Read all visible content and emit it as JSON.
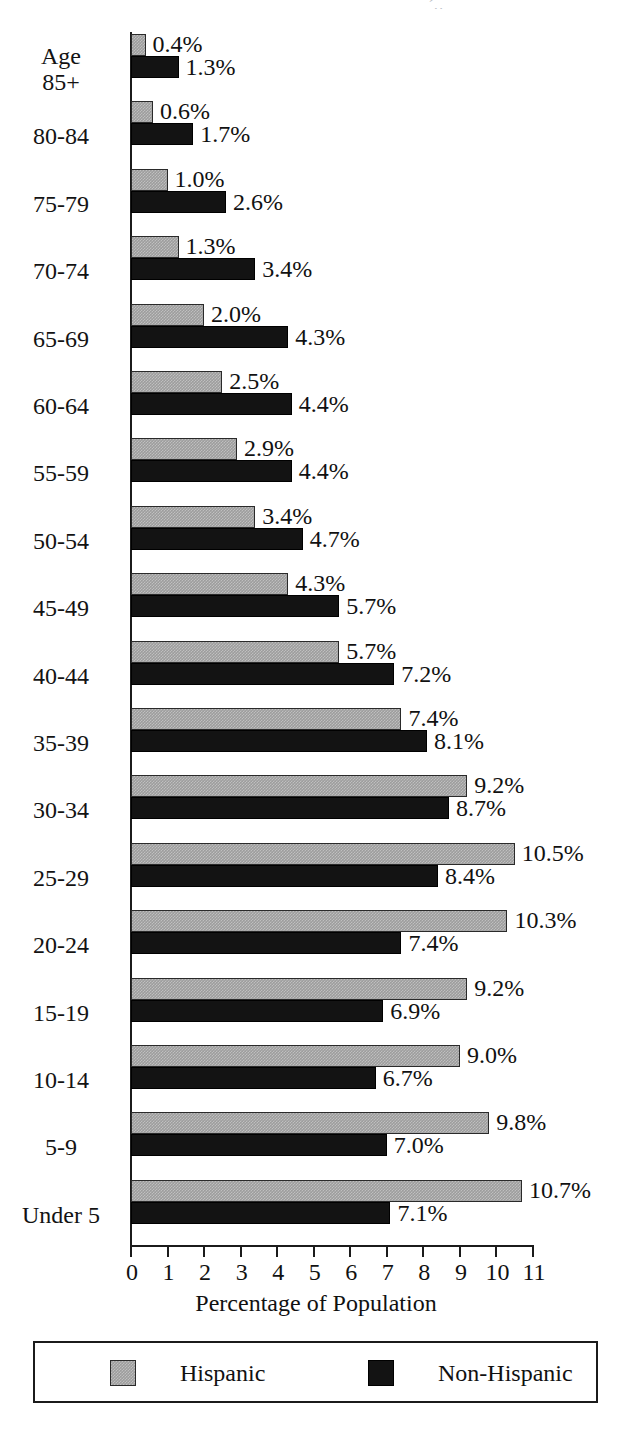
{
  "scan_artifact": "´,,",
  "chart_data": {
    "type": "bar",
    "orientation": "horizontal",
    "title": "",
    "subtitle": "",
    "xlabel": "Percentage of Population",
    "ylabel": "",
    "xlim": [
      0,
      11
    ],
    "xticks": [
      "0",
      "1",
      "2",
      "3",
      "4",
      "5",
      "6",
      "7",
      "8",
      "9",
      "10",
      "11"
    ],
    "grid": false,
    "legend_position": "bottom",
    "value_suffix": "%",
    "categories": [
      "Age 85+",
      "80-84",
      "75-79",
      "70-74",
      "65-69",
      "60-64",
      "55-59",
      "50-54",
      "45-49",
      "40-44",
      "35-39",
      "30-34",
      "25-29",
      "20-24",
      "15-19",
      "10-14",
      "5-9",
      "Under 5"
    ],
    "category_lines": [
      [
        "Age",
        "85+"
      ],
      [
        "80-84"
      ],
      [
        "75-79"
      ],
      [
        "70-74"
      ],
      [
        "65-69"
      ],
      [
        "60-64"
      ],
      [
        "55-59"
      ],
      [
        "50-54"
      ],
      [
        "45-49"
      ],
      [
        "40-44"
      ],
      [
        "35-39"
      ],
      [
        "30-34"
      ],
      [
        "25-29"
      ],
      [
        "20-24"
      ],
      [
        "15-19"
      ],
      [
        "10-14"
      ],
      [
        "5-9"
      ],
      [
        "Under 5"
      ]
    ],
    "series": [
      {
        "name": "Hispanic",
        "color": "#9d9d9d",
        "values": [
          0.4,
          0.6,
          1.0,
          1.3,
          2.0,
          2.5,
          2.9,
          3.4,
          4.3,
          5.7,
          7.4,
          9.2,
          10.5,
          10.3,
          9.2,
          9.0,
          9.8,
          10.7
        ],
        "labels": [
          "0.4%",
          "0.6%",
          "1.0%",
          "1.3%",
          "2.0%",
          "2.5%",
          "2.9%",
          "3.4%",
          "4.3%",
          "5.7%",
          "7.4%",
          "9.2%",
          "10.5%",
          "10.3%",
          "9.2%",
          "9.0%",
          "9.8%",
          "10.7%"
        ]
      },
      {
        "name": "Non-Hispanic",
        "color": "#131313",
        "values": [
          1.3,
          1.7,
          2.6,
          3.4,
          4.3,
          4.4,
          4.4,
          4.7,
          5.7,
          7.2,
          8.1,
          8.7,
          8.4,
          7.4,
          6.9,
          6.7,
          7.0,
          7.1
        ],
        "labels": [
          "1.3%",
          "1.7%",
          "2.6%",
          "3.4%",
          "4.3%",
          "4.4%",
          "4.4%",
          "4.7%",
          "5.7%",
          "7.2%",
          "8.1%",
          "8.7%",
          "8.4%",
          "7.4%",
          "6.9%",
          "6.7%",
          "7.0%",
          "7.1%"
        ]
      }
    ]
  },
  "legend": {
    "entries": [
      {
        "label": "Hispanic",
        "color": "#9d9d9d"
      },
      {
        "label": "Non-Hispanic",
        "color": "#131313"
      }
    ]
  }
}
